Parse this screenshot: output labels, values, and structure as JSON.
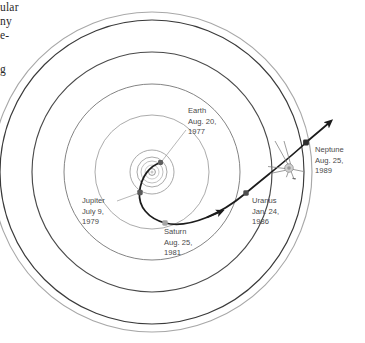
{
  "page": {
    "margin_column_fragments": [
      {
        "text": "ular",
        "top": 2
      },
      {
        "text": "ny",
        "top": 16
      },
      {
        "text": "e-",
        "top": 30
      },
      {
        "text": "g",
        "top": 64
      }
    ]
  },
  "diagram": {
    "name": "voyager-2-trajectory-diagram",
    "center": {
      "x": 152,
      "y": 172
    },
    "colors": {
      "orbit_dark": "#3a3a3a",
      "orbit_mid": "#6e6e6e",
      "orbit_light": "#b9b9b9",
      "trajectory": "#1c1c1c",
      "leader_line": "#9a9a9a",
      "label_text": "#4a4a4a",
      "planet_dot_dark": "#5a5a5a",
      "planet_dot_light": "#a9a9a9",
      "background": "#ffffff"
    },
    "orbits": [
      {
        "name": "mercury-orbit",
        "radius": 7,
        "stroke": "#c2c2c2"
      },
      {
        "name": "venus-orbit",
        "radius": 11,
        "stroke": "#b4b4b4"
      },
      {
        "name": "earth-orbit",
        "radius": 15,
        "stroke": "#9a9a9a"
      },
      {
        "name": "mars-orbit",
        "radius": 22,
        "stroke": "#9a9a9a"
      },
      {
        "name": "jupiter-orbit",
        "radius": 57,
        "stroke": "#9c9c9c"
      },
      {
        "name": "saturn-orbit",
        "radius": 88,
        "stroke": "#6e6e6e"
      },
      {
        "name": "uranus-orbit",
        "radius": 120,
        "stroke": "#4a4a4a"
      },
      {
        "name": "neptune-orbit",
        "radius": 152,
        "stroke": "#3a3a3a"
      },
      {
        "name": "pluto-orbit",
        "radius": 160,
        "stroke": "#a8a8a8"
      }
    ],
    "sun": {
      "name": "sun-marker",
      "x": 152,
      "y": 172,
      "radius": 3.2
    },
    "planets": [
      {
        "name": "earth-marker",
        "label_key": "earth",
        "x": 160.5,
        "y": 162.5,
        "size": 5.0,
        "color": "#5e5e5e"
      },
      {
        "name": "jupiter-marker",
        "label_key": "jupiter",
        "x": 140.0,
        "y": 192.5,
        "size": 5.4,
        "color": "#5a5a5a"
      },
      {
        "name": "saturn-marker",
        "label_key": "saturn",
        "x": 165.0,
        "y": 223.0,
        "size": 5.4,
        "color": "#a5a5a5"
      },
      {
        "name": "uranus-marker",
        "label_key": "uranus",
        "x": 246.0,
        "y": 193.0,
        "size": 5.4,
        "color": "#4e4e4e"
      },
      {
        "name": "neptune-marker",
        "label_key": "neptune",
        "x": 306.0,
        "y": 142.5,
        "size": 5.8,
        "color": "#2e2e2e"
      }
    ],
    "labels": {
      "earth": {
        "name": "label-earth",
        "lines": [
          "Earth",
          "Aug. 20,",
          "1977"
        ],
        "x": 188,
        "y": 113,
        "leader": {
          "x1": 186,
          "y1": 130,
          "x2": 162,
          "y2": 161
        }
      },
      "jupiter": {
        "name": "label-jupiter",
        "lines": [
          "Jupiter",
          "July 9,",
          "1979"
        ],
        "x": 82,
        "y": 203,
        "leader": {
          "x1": 117,
          "y1": 201,
          "x2": 139,
          "y2": 193
        }
      },
      "saturn": {
        "name": "label-saturn",
        "lines": [
          "Saturn",
          "Aug. 25,",
          "1981"
        ],
        "x": 164,
        "y": 234,
        "leader": null
      },
      "uranus": {
        "name": "label-uranus",
        "lines": [
          "Uranus",
          "Jan. 24,",
          "1986"
        ],
        "x": 252,
        "y": 203,
        "leader": null
      },
      "neptune": {
        "name": "label-neptune",
        "lines": [
          "Neptune",
          "Aug. 25,",
          "1989"
        ],
        "x": 315,
        "y": 152,
        "leader": null
      }
    },
    "spacecraft": {
      "name": "voyager-spacecraft-icon",
      "x": 289,
      "y": 168,
      "description": "voyager-probe"
    },
    "trajectory": {
      "name": "voyager-trajectory-path",
      "description": "Voyager 2 flight path from Earth past Jupiter, Saturn, Uranus and Neptune, continuing out of the solar system",
      "arrow_count": 2
    }
  }
}
